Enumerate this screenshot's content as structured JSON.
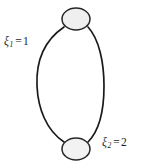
{
  "figure": {
    "type": "graph-diagram",
    "background_color": "#ffffff",
    "stroke_color": "#1a1a1a",
    "node_fill_color": "#eeeeee"
  },
  "nodes": [
    {
      "id": "top-vertex",
      "name": "top-vertex",
      "cx": 76,
      "cy": 19,
      "rx": 14,
      "ry": 11
    },
    {
      "id": "bottom-vertex",
      "name": "bottom-vertex",
      "cx": 76,
      "cy": 149,
      "rx": 14,
      "ry": 11
    }
  ],
  "edges": [
    {
      "id": "left-edge",
      "name": "left-edge",
      "label": {
        "symbol": "ξ",
        "subscript": "1",
        "equals": "=",
        "value": "1",
        "full_text": "ξ₁ = 1"
      }
    },
    {
      "id": "right-edge",
      "name": "right-edge",
      "label": {
        "symbol": "ξ",
        "subscript": "2",
        "equals": "=",
        "value": "2",
        "full_text": "ξ₂ = 2"
      }
    }
  ]
}
